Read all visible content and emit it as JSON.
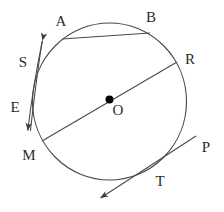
{
  "figure": {
    "type": "geometry-diagram",
    "background_color": "#ffffff",
    "stroke_color": "#4a4a4a",
    "label_color": "#2b2b2b",
    "center_dot_color": "#000000",
    "canvas": {
      "width": 224,
      "height": 212
    }
  },
  "circle": {
    "center": {
      "x": 109.5,
      "y": 101.5
    },
    "radius": 77,
    "center_point_name": "O"
  },
  "labels": [
    {
      "id": "A",
      "text": "A",
      "x": 61,
      "y": 26,
      "anchor": "middle"
    },
    {
      "id": "B",
      "text": "B",
      "x": 151,
      "y": 22,
      "anchor": "middle"
    },
    {
      "id": "R",
      "text": "R",
      "x": 190,
      "y": 64,
      "anchor": "middle"
    },
    {
      "id": "P",
      "text": "P",
      "x": 206,
      "y": 152,
      "anchor": "middle"
    },
    {
      "id": "T",
      "text": "T",
      "x": 160,
      "y": 186,
      "anchor": "middle"
    },
    {
      "id": "M",
      "text": "M",
      "x": 29,
      "y": 160,
      "anchor": "middle"
    },
    {
      "id": "E",
      "text": "E",
      "x": 15,
      "y": 112,
      "anchor": "middle"
    },
    {
      "id": "S",
      "text": "S",
      "x": 23,
      "y": 67,
      "anchor": "middle"
    },
    {
      "id": "O",
      "text": "O",
      "x": 118,
      "y": 115,
      "anchor": "middle"
    }
  ],
  "segments": [
    {
      "id": "chord-AB",
      "name": "chord",
      "from_label": "A",
      "to_label": "B",
      "from": {
        "x": 62,
        "y": 39
      },
      "to": {
        "x": 150,
        "y": 33
      },
      "arrows": "none"
    },
    {
      "id": "diameter-MR",
      "name": "diameter",
      "from_label": "M",
      "to_label": "R",
      "from": {
        "x": 42,
        "y": 141
      },
      "to": {
        "x": 177,
        "y": 62
      },
      "passes_through": "O",
      "arrows": "none"
    },
    {
      "id": "secant-SE",
      "name": "secant-line",
      "from_label": "S",
      "to_label": "E",
      "from": {
        "x": 42,
        "y": 38
      },
      "to": {
        "x": 27,
        "y": 133
      },
      "arrows": "both"
    },
    {
      "id": "tangent-TP",
      "name": "tangent-line",
      "from_label": "T",
      "to_label": "P",
      "from": {
        "x": 197,
        "y": 135
      },
      "to": {
        "x": 99,
        "y": 199
      },
      "tangent_point": {
        "x": 161,
        "y": 162
      },
      "arrows": "one-end-lower-left"
    }
  ],
  "points_on_circle": [
    {
      "label": "A",
      "x": 62,
      "y": 39
    },
    {
      "label": "B",
      "x": 150,
      "y": 33
    },
    {
      "label": "R",
      "x": 177,
      "y": 62
    },
    {
      "label": "M",
      "x": 42,
      "y": 141
    },
    {
      "label": "T",
      "x": 161,
      "y": 162
    }
  ]
}
